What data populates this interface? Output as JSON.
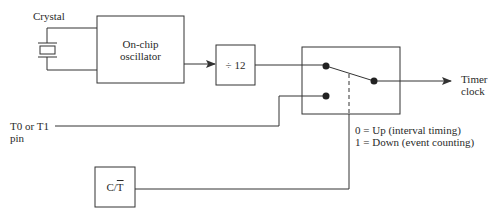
{
  "diagram": {
    "type": "block-diagram",
    "colors": {
      "line": "#333333",
      "background": "#ffffff",
      "text": "#2a2a2a"
    },
    "nodes": {
      "crystal": {
        "label": "Crystal"
      },
      "oscillator": {
        "line1": "On-chip",
        "line2": "oscillator"
      },
      "divider": {
        "label": "÷ 12"
      },
      "switch": {
        "label": ""
      },
      "ct_bit": {
        "label_c": "C/",
        "label_t": "T"
      },
      "t_pin": {
        "line1": "T0 or T1",
        "line2": "pin"
      },
      "output": {
        "line1": "Timer",
        "line2": "clock"
      }
    },
    "legend": {
      "line1": "0 = Up (interval timing)",
      "line2": "1 = Down (event counting)"
    },
    "edges": [
      {
        "from": "crystal",
        "to": "oscillator"
      },
      {
        "from": "oscillator",
        "to": "divider",
        "arrow": true
      },
      {
        "from": "divider",
        "to": "switch"
      },
      {
        "from": "t_pin",
        "to": "switch"
      },
      {
        "from": "switch",
        "to": "output",
        "arrow": true
      },
      {
        "from": "ct_bit",
        "to": "switch",
        "style": "dashed-control"
      }
    ]
  }
}
